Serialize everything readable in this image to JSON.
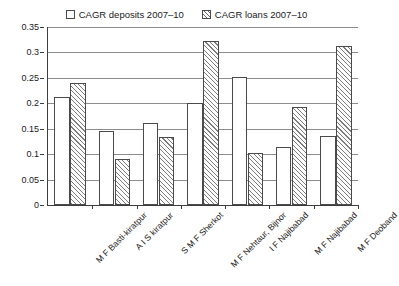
{
  "chart_data": {
    "type": "bar",
    "title": "",
    "subtitle": "",
    "xlabel": "",
    "ylabel": "",
    "ylim": [
      0,
      0.35
    ],
    "ytick_labels": [
      "0",
      "0.05",
      "0.1",
      "0.15",
      "0.2",
      "0.25",
      "0.3",
      "0.35"
    ],
    "ytick_values": [
      0,
      0.05,
      0.1,
      0.15,
      0.2,
      0.25,
      0.3,
      0.35
    ],
    "grid": true,
    "legend_position": "top-center",
    "categories": [
      "M F Basti-kiratpur",
      "A I S kiratpur",
      "S M F Sherkot",
      "M F Nehtaur, Bijnor",
      "I F Najibabad",
      "M F Najibabad",
      "M F Deoband"
    ],
    "series": [
      {
        "name": "CAGR deposits 2007–10",
        "style": "plain",
        "values": [
          0.212,
          0.146,
          0.161,
          0.2,
          0.252,
          0.115,
          0.135
        ]
      },
      {
        "name": "CAGR loans 2007–10",
        "style": "hatched",
        "values": [
          0.239,
          0.091,
          0.133,
          0.323,
          0.102,
          0.192,
          0.313
        ]
      }
    ],
    "colors": {
      "axis": "#3d3d3d",
      "gridline": "#8c8c8c",
      "bar_outline": "#4a4a4a",
      "deposits_fill": "#ffffff",
      "loans_hatch": "#7d7d7d",
      "text": "#1a1a1a"
    }
  },
  "legend": {
    "entries": [
      {
        "label": "CAGR deposits 2007–10",
        "swatch": "plain-swatch-icon"
      },
      {
        "label": "CAGR loans 2007–10",
        "swatch": "hatched-swatch-icon"
      }
    ]
  }
}
